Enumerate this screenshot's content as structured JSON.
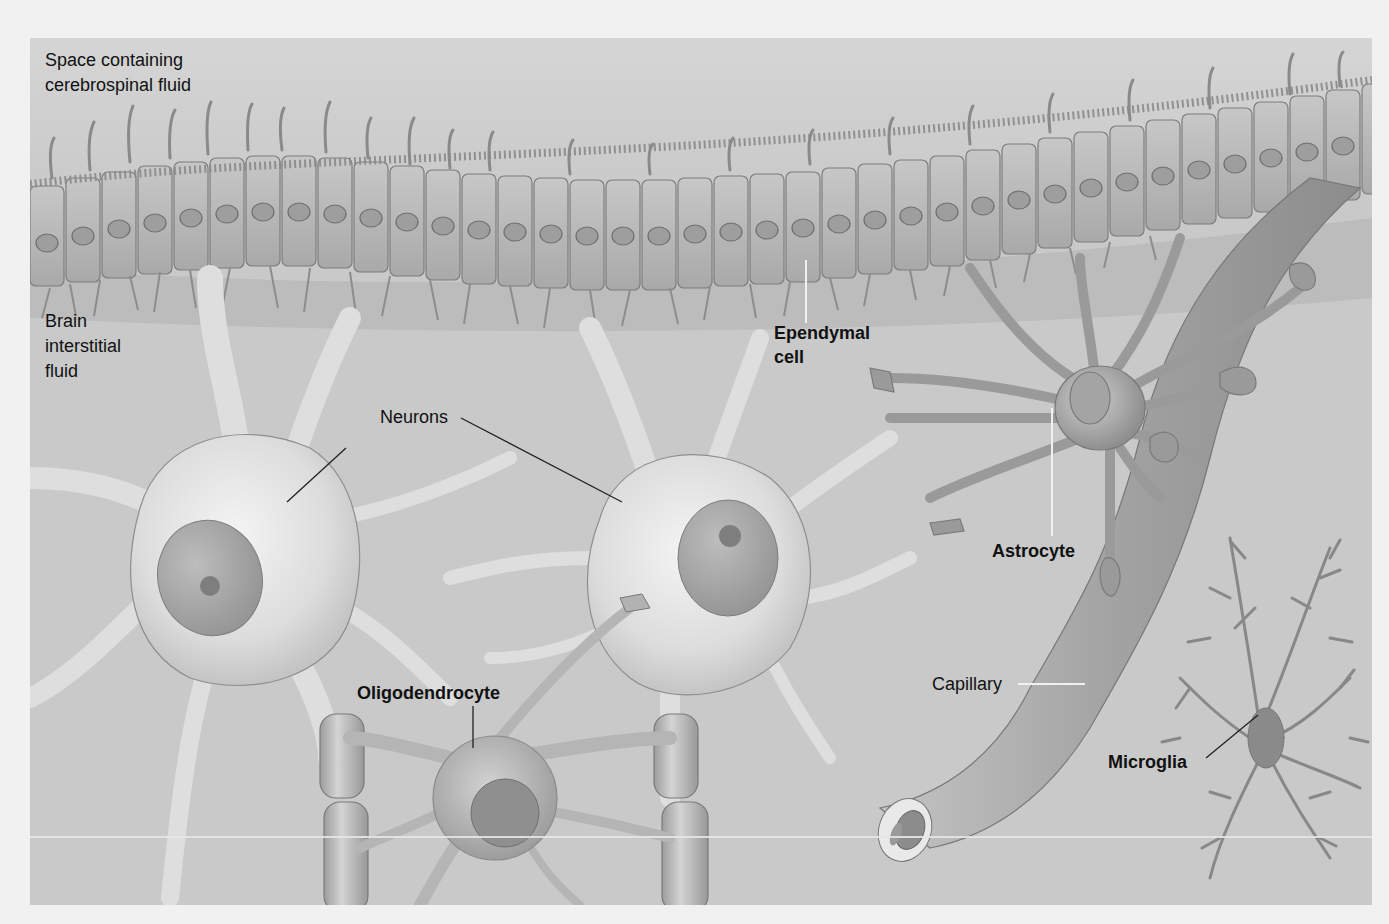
{
  "figure": {
    "background_color": "#c9c9c9",
    "page_color": "#f1f1f1",
    "cell_colors": {
      "ependymal": "#b9b9b9",
      "neuron": "#e4e4e4",
      "nucleus": "#a4a4a4",
      "nucleolus": "#7e7e7e",
      "astrocyte": "#a9a9a9",
      "capillary": "#a2a2a2",
      "oligodendrocyte": "#b5b5b5",
      "myelin": "#b7b7b7",
      "microglia": "#888888",
      "outline": "#7a7a7a"
    }
  },
  "regions": {
    "csf_line1": "Space containing",
    "csf_line2": "cerebrospinal fluid",
    "interstitial_line1": "Brain",
    "interstitial_line2": "interstitial",
    "interstitial_line3": "fluid"
  },
  "labels": {
    "ependymal_line1": "Ependymal",
    "ependymal_line2": "cell",
    "neurons": "Neurons",
    "astrocyte": "Astrocyte",
    "capillary": "Capillary",
    "oligodendrocyte": "Oligodendrocyte",
    "microglia": "Microglia"
  }
}
